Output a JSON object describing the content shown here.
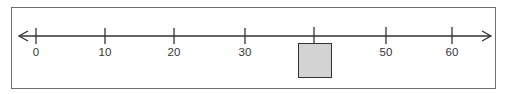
{
  "number_line": {
    "min_arrow": "left-arrow",
    "max_arrow": "right-arrow",
    "ticks": [
      {
        "value": 0,
        "label": "0",
        "x": 36
      },
      {
        "value": 10,
        "label": "10",
        "x": 105
      },
      {
        "value": 20,
        "label": "20",
        "x": 174
      },
      {
        "value": 30,
        "label": "30",
        "x": 245
      },
      {
        "value": 40,
        "label": "",
        "x": 314,
        "hidden_by_box": true
      },
      {
        "value": 50,
        "label": "50",
        "x": 384
      },
      {
        "value": 60,
        "label": "60",
        "x": 452
      }
    ],
    "answer_box": {
      "tick_value": 40,
      "fill": "#d3d3d3",
      "content": ""
    }
  },
  "colors": {
    "line": "#333333",
    "frame": "#6e6e6e",
    "box_fill": "#d3d3d3"
  }
}
